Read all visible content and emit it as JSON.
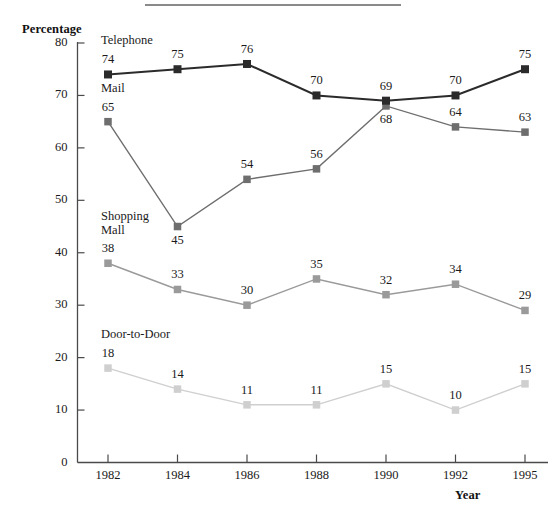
{
  "figure": {
    "divider_present": true
  },
  "axes": {
    "y_title": "Percentage",
    "x_title": "Year",
    "y_ticks": [
      "0",
      "10",
      "20",
      "30",
      "40",
      "50",
      "60",
      "70",
      "80"
    ],
    "x_ticks": [
      "1982",
      "1984",
      "1986",
      "1988",
      "1990",
      "1992",
      "1995"
    ]
  },
  "chart_data": {
    "type": "line",
    "title": "",
    "subtitle": "",
    "xlabel": "Year",
    "ylabel": "Percentage",
    "categories": [
      "1982",
      "1984",
      "1986",
      "1988",
      "1990",
      "1992",
      "1995"
    ],
    "ylim": [
      0,
      80
    ],
    "ytick_step": 10,
    "xlim_categorical": true,
    "grid": false,
    "legend": "inline-series-labels",
    "marker": "square",
    "series": [
      {
        "name": "Telephone",
        "color": "#2b2b2b",
        "label_position": "above-first-point",
        "values": [
          74,
          75,
          76,
          70,
          69,
          70,
          75
        ],
        "point_labels": [
          "74",
          "75",
          "76",
          "70",
          "69",
          "70",
          "75"
        ],
        "point_label_side": [
          "above",
          "above",
          "above",
          "above",
          "above",
          "above",
          "above"
        ]
      },
      {
        "name": "Mail",
        "color": "#6e6e6e",
        "label_position": "above-first-point",
        "values": [
          65,
          45,
          54,
          56,
          68,
          64,
          63
        ],
        "point_labels": [
          "65",
          "45",
          "54",
          "56",
          "68",
          "64",
          "63"
        ],
        "point_label_side": [
          "above",
          "below",
          "above",
          "above",
          "below",
          "above",
          "above"
        ]
      },
      {
        "name": "Shopping\nMall",
        "color": "#9a9a9a",
        "label_position": "above-first-point",
        "values": [
          38,
          33,
          30,
          35,
          32,
          34,
          29
        ],
        "point_labels": [
          "38",
          "33",
          "30",
          "35",
          "32",
          "34",
          "29"
        ],
        "point_label_side": [
          "above",
          "above",
          "above",
          "above",
          "above",
          "above",
          "above"
        ]
      },
      {
        "name": "Door-to-Door",
        "color": "#cfcfcf",
        "label_position": "above-first-point",
        "values": [
          18,
          14,
          11,
          11,
          15,
          10,
          15
        ],
        "point_labels": [
          "18",
          "14",
          "11",
          "11",
          "15",
          "10",
          "15"
        ],
        "point_label_side": [
          "above",
          "above",
          "above",
          "above",
          "above",
          "above",
          "above"
        ]
      }
    ]
  }
}
